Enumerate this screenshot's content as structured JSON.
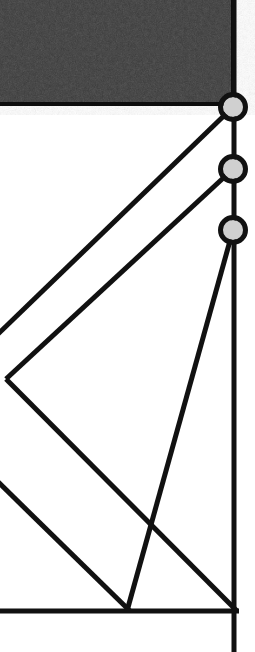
{
  "scene": {
    "title": "Structural truss frame detail",
    "kind": "engineering-line-drawing",
    "canvas": {
      "width": 255,
      "height": 652
    },
    "background_color": "#ffffff",
    "line_color": "#111111",
    "line_width": 5
  },
  "dark_panel": {
    "name": "shaded-panel",
    "fill_color": "#383838",
    "texture": "mottled-grain",
    "x": 0,
    "y": 0,
    "width": 233,
    "height": 104,
    "border_color": "#0d0d0d",
    "border_width": 4,
    "seam_line": {
      "color": "#4a4a4a",
      "y": 52,
      "width": 1
    }
  },
  "vertical_chord": {
    "name": "right-vertical-chord",
    "x": 234,
    "y_top": 0,
    "y_bottom": 652,
    "width": 5,
    "color": "#111111"
  },
  "bottom_chord": {
    "name": "bottom-horizontal-chord",
    "y": 611,
    "x_start": 0,
    "x_end": 239,
    "width": 5,
    "color": "#111111"
  },
  "nodes": [
    {
      "id": "node-1",
      "label": "top-joint",
      "cx": 233,
      "cy": 107,
      "outer_radius": 15,
      "inner_radius": 10,
      "ring_color": "#111111",
      "fill_color": "#d0d0d0"
    },
    {
      "id": "node-2",
      "label": "middle-joint",
      "cx": 233,
      "cy": 169,
      "outer_radius": 15,
      "inner_radius": 10,
      "ring_color": "#111111",
      "fill_color": "#d0d0d0"
    },
    {
      "id": "node-3",
      "label": "lower-joint",
      "cx": 233,
      "cy": 230,
      "outer_radius": 15,
      "inner_radius": 10,
      "ring_color": "#111111",
      "fill_color": "#d0d0d0"
    }
  ],
  "diagonals": [
    {
      "id": "diagonal-1",
      "label": "brace-from-top-joint",
      "from_node": "node-1",
      "x1": 233,
      "y1": 107,
      "x2": -4,
      "y2": 336,
      "width": 5
    },
    {
      "id": "diagonal-2",
      "label": "brace-from-middle-joint",
      "from_node": "node-2",
      "x1": 233,
      "y1": 169,
      "x2": 6,
      "y2": 379,
      "width": 5
    },
    {
      "id": "diagonal-3",
      "label": "brace-from-lower-joint-to-base",
      "from_node": "node-3",
      "x1": 233,
      "y1": 230,
      "x2": 127,
      "y2": 611,
      "width": 5
    },
    {
      "id": "diagonal-4",
      "label": "brace-from-left-vertex-to-base",
      "from_node": "left-vertex",
      "x1": 6,
      "y1": 379,
      "x2": 237,
      "y2": 611,
      "width": 5
    },
    {
      "id": "diagonal-5",
      "label": "lower-left-brace",
      "from_node": "left-edge",
      "x1": -6,
      "y1": 478,
      "x2": 130,
      "y2": 611,
      "width": 5
    }
  ],
  "vertices": [
    {
      "id": "left-vertex",
      "label": "left-edge-apex",
      "x": 6,
      "y": 379
    },
    {
      "id": "base-junction-left",
      "label": "base-junction-left",
      "x": 127,
      "y": 611
    },
    {
      "id": "base-junction-right",
      "label": "base-junction-right",
      "x": 234,
      "y": 611
    }
  ]
}
